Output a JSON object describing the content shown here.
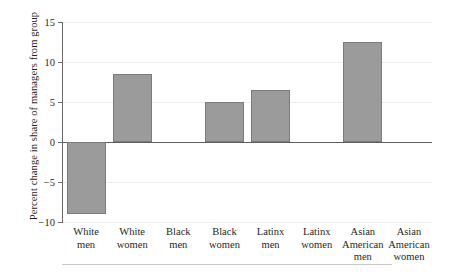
{
  "chart_data": {
    "type": "bar",
    "title": "",
    "xlabel": "",
    "ylabel": "Percent change in share of managers from group",
    "categories": [
      "White men",
      "White women",
      "Black men",
      "Black women",
      "Latinx men",
      "Latinx women",
      "Asian American men",
      "Asian American women"
    ],
    "category_lines": [
      [
        "White",
        "men"
      ],
      [
        "White",
        "women"
      ],
      [
        "Black",
        "men"
      ],
      [
        "Black",
        "women"
      ],
      [
        "Latinx",
        "men"
      ],
      [
        "Latinx",
        "women"
      ],
      [
        "Asian",
        "American",
        "men"
      ],
      [
        "Asian",
        "American",
        "women"
      ]
    ],
    "values": [
      -9.0,
      8.5,
      0.0,
      5.0,
      6.5,
      0.0,
      12.5,
      0.0
    ],
    "ylim": [
      -10,
      15
    ],
    "yticks": [
      15,
      10,
      5,
      0,
      -5,
      -10
    ],
    "ytick_labels": [
      "15",
      "10",
      "5",
      "0",
      "−5",
      "−10"
    ],
    "grid": true,
    "legend": null,
    "bar_color": "#9b9b9b",
    "bar_edge_color": "#7b7b7b",
    "axis_color": "#5d5d5d",
    "grid_color": "#ededed"
  }
}
